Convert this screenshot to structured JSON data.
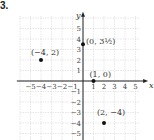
{
  "problem_label": "3.",
  "chart_data": {
    "type": "scatter",
    "title": "",
    "xlabel": "x",
    "ylabel": "y",
    "xlim": [
      -5,
      5
    ],
    "ylim": [
      -5,
      5
    ],
    "grid": true,
    "x_ticks": [
      "-5",
      "-4",
      "-3",
      "-2",
      "-1",
      "1",
      "2",
      "3",
      "4",
      "5"
    ],
    "y_ticks": [
      "5",
      "4",
      "3",
      "2",
      "1",
      "-1",
      "-2",
      "-3",
      "-4",
      "-5"
    ],
    "points": [
      {
        "x": -4,
        "y": 2,
        "label": "(−4, 2)"
      },
      {
        "x": 0,
        "y": 3.5,
        "label": "(0, 3½)"
      },
      {
        "x": 1,
        "y": 0,
        "label": "(1, 0)"
      },
      {
        "x": 2,
        "y": -4,
        "label": "(2, −4)"
      }
    ]
  }
}
